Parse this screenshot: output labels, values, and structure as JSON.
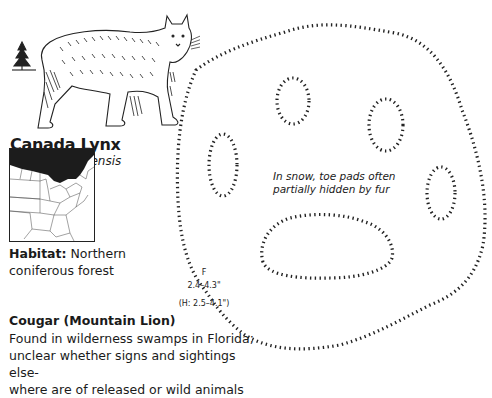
{
  "species": {
    "common_name": "Canada Lynx",
    "scientific_name": "Lynx canadensis",
    "habitat_label": "Habitat:",
    "habitat_value": "Northern coniferous forest",
    "habitat_line1": "Northern",
    "habitat_line2": "coniferous forest"
  },
  "track": {
    "foot_label": "F",
    "size": "2.4–4.3\"",
    "hind_size": "(H: 2.5–4.1\")",
    "note_line1": "In snow, toe pads often",
    "note_line2": "partially hidden by fur"
  },
  "related": {
    "heading": "Cougar (Mountain Lion)",
    "line1": "Found in wilderness swamps in Florida;",
    "line2": "unclear whether signs and sightings else-",
    "line3": "where are of released or wild animals"
  },
  "icons": {
    "tree": "conifer-tree-icon",
    "animal": "lynx-illustration",
    "map": "range-map",
    "track": "paw-track-outline"
  },
  "colors": {
    "ink": "#1a1a1a",
    "range_fill": "#1c1c1c",
    "background": "#ffffff"
  }
}
